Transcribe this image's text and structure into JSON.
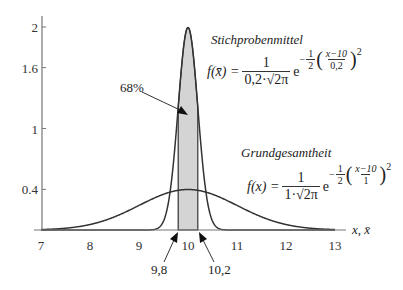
{
  "chart_data": {
    "type": "line",
    "title": "",
    "xlabel": "x, x̄",
    "ylabel": "",
    "xlim": [
      7,
      13
    ],
    "ylim": [
      0,
      2
    ],
    "x_ticks": [
      "7",
      "8",
      "9",
      "10",
      "11",
      "12",
      "13"
    ],
    "y_ticks": [
      "0.4",
      "1",
      "1.6",
      "2"
    ],
    "grid": false,
    "legend": null,
    "series": [
      {
        "name": "Stichprobenmittel",
        "distribution": "normal",
        "mean": 10,
        "sd": 0.2,
        "peak": 1.995
      },
      {
        "name": "Grundgesamtheit",
        "distribution": "normal",
        "mean": 10,
        "sd": 1,
        "peak": 0.399
      }
    ],
    "shaded_region": {
      "from": 9.8,
      "to": 10.2,
      "label": "68%"
    },
    "annotations": [
      "68%",
      "9,8",
      "10,2"
    ]
  },
  "labels": {
    "sample_title": "Stichprobenmittel",
    "population_title": "Grundgesamtheit",
    "percent": "68%",
    "lower_bound": "9,8",
    "upper_bound": "10,2",
    "x_axis": "x, x̄"
  },
  "formula_sample": {
    "lhs": "f(x̄) =",
    "num": "1",
    "den": "0,2·√2π",
    "e": "e",
    "exp_sign": "−",
    "exp_num": "1",
    "exp_den": "2",
    "inner_num": "x−10",
    "inner_den": "0,2",
    "power": "2"
  },
  "formula_population": {
    "lhs": "f(x) =",
    "num": "1",
    "den": "1·√2π",
    "e": "e",
    "exp_sign": "−",
    "exp_num": "1",
    "exp_den": "2",
    "inner_num": "x−10",
    "inner_den": "1",
    "power": "2"
  },
  "colors": {
    "axis": "#777777",
    "curve": "#333333",
    "shade": "#d4d4d4"
  }
}
